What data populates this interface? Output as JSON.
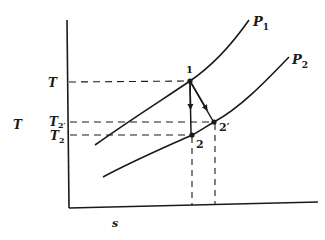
{
  "diagram": {
    "type": "T-s diagram (isentropic vs actual expansion)",
    "axes": {
      "y_label": "T",
      "x_label": "s"
    },
    "curves": [
      {
        "id": "P1",
        "label": "P",
        "subscript": "1"
      },
      {
        "id": "P2",
        "label": "P",
        "subscript": "2"
      }
    ],
    "points": [
      {
        "id": "1",
        "label": "1"
      },
      {
        "id": "2",
        "label": "2"
      },
      {
        "id": "2p",
        "label": "2′"
      }
    ],
    "temperature_levels": [
      {
        "id": "T",
        "label": "T",
        "subscript": ""
      },
      {
        "id": "T2p",
        "label": "T",
        "subscript": "2′"
      },
      {
        "id": "T2",
        "label": "T",
        "subscript": "2"
      }
    ],
    "processes": [
      {
        "from": "1",
        "to": "2",
        "kind": "isentropic (vertical arrow)"
      },
      {
        "from": "1",
        "to": "2′",
        "kind": "actual (slanted arrow)"
      }
    ]
  },
  "colors": {
    "ink": "#1a1a1a",
    "background": "#ffffff"
  }
}
